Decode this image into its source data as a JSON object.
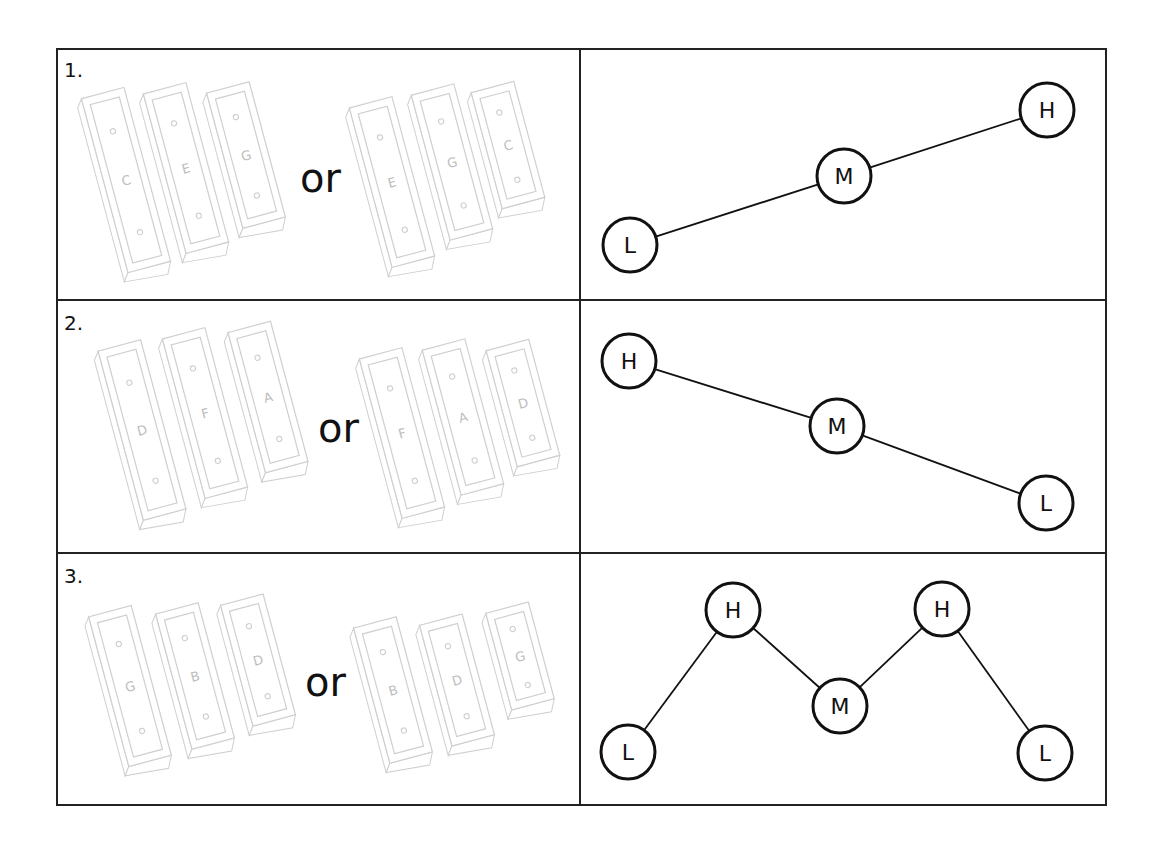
{
  "table": {
    "left": 57,
    "top": 49,
    "right": 1106,
    "bottom": 805,
    "divider_x": 580,
    "row_dividers": [
      300,
      553
    ],
    "border_color": "#222222"
  },
  "rows": [
    {
      "number": "1.",
      "connector": "or",
      "bar_groups": [
        [
          {
            "letter": "C",
            "cx": 126,
            "cy": 180,
            "h": 180
          },
          {
            "letter": "E",
            "cx": 186,
            "cy": 168,
            "h": 165
          },
          {
            "letter": "G",
            "cx": 246,
            "cy": 155,
            "h": 140
          }
        ],
        [
          {
            "letter": "E",
            "cx": 392,
            "cy": 182,
            "h": 165
          },
          {
            "letter": "G",
            "cx": 452,
            "cy": 162,
            "h": 150
          },
          {
            "letter": "C",
            "cx": 508,
            "cy": 145,
            "h": 120
          }
        ]
      ],
      "contour": {
        "pattern": "ascending",
        "nodes": [
          {
            "label": "L",
            "x": 630,
            "y": 245
          },
          {
            "label": "M",
            "x": 844,
            "y": 176
          },
          {
            "label": "H",
            "x": 1047,
            "y": 110
          }
        ],
        "edges": [
          [
            0,
            1
          ],
          [
            1,
            2
          ]
        ]
      }
    },
    {
      "number": "2.",
      "connector": "or",
      "bar_groups": [
        [
          {
            "letter": "D",
            "cx": 142,
            "cy": 430,
            "h": 175
          },
          {
            "letter": "F",
            "cx": 205,
            "cy": 413,
            "h": 165
          },
          {
            "letter": "A",
            "cx": 268,
            "cy": 397,
            "h": 145
          }
        ],
        [
          {
            "letter": "F",
            "cx": 402,
            "cy": 433,
            "h": 165
          },
          {
            "letter": "A",
            "cx": 463,
            "cy": 417,
            "h": 150
          },
          {
            "letter": "D",
            "cx": 523,
            "cy": 403,
            "h": 120
          }
        ]
      ],
      "contour": {
        "pattern": "descending",
        "nodes": [
          {
            "label": "H",
            "x": 629,
            "y": 361
          },
          {
            "label": "M",
            "x": 837,
            "y": 426
          },
          {
            "label": "L",
            "x": 1046,
            "y": 503
          }
        ],
        "edges": [
          [
            0,
            1
          ],
          [
            1,
            2
          ]
        ]
      }
    },
    {
      "number": "3.",
      "connector": "or",
      "bar_groups": [
        [
          {
            "letter": "G",
            "cx": 130,
            "cy": 686,
            "h": 155
          },
          {
            "letter": "B",
            "cx": 195,
            "cy": 676,
            "h": 140
          },
          {
            "letter": "D",
            "cx": 258,
            "cy": 660,
            "h": 125
          }
        ],
        [
          {
            "letter": "B",
            "cx": 393,
            "cy": 690,
            "h": 140
          },
          {
            "letter": "D",
            "cx": 457,
            "cy": 680,
            "h": 125
          },
          {
            "letter": "G",
            "cx": 520,
            "cy": 656,
            "h": 100
          }
        ]
      ],
      "contour": {
        "pattern": "zigzag",
        "nodes": [
          {
            "label": "L",
            "x": 628,
            "y": 752
          },
          {
            "label": "H",
            "x": 733,
            "y": 610
          },
          {
            "label": "M",
            "x": 840,
            "y": 706
          },
          {
            "label": "H",
            "x": 942,
            "y": 609
          },
          {
            "label": "L",
            "x": 1045,
            "y": 753
          }
        ],
        "edges": [
          [
            0,
            1
          ],
          [
            1,
            2
          ],
          [
            2,
            3
          ],
          [
            3,
            4
          ]
        ]
      }
    }
  ],
  "style": {
    "bar_stroke": "#cfcfcf",
    "bar_letter": "#bdbdbd",
    "node_stroke": "#111111",
    "node_radius": 27
  }
}
